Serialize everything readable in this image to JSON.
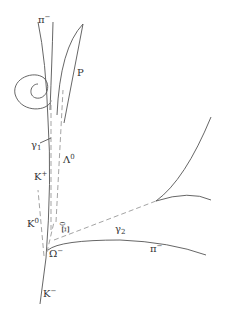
{
  "diagram": {
    "colors": {
      "charged_track": "#555555",
      "neutral_track": "#999999",
      "text": "#333333"
    },
    "legend_convention": {
      "solid": "charged particle track",
      "dashed": "neutral particle path"
    },
    "labels": {
      "pi_minus_top": "π",
      "pi_minus_top_sup": "−",
      "proton": "P",
      "gamma1": "γ",
      "gamma1_sub": "1",
      "lambda0": "Λ",
      "lambda0_sup": "0",
      "k_plus": "K",
      "k_plus_sup": "+",
      "gamma2": "γ",
      "gamma2_sub": "2",
      "k0": "K",
      "k0_sup": "0",
      "xi0": "Ξ",
      "xi0_sup": "0",
      "omega_minus": "Ω",
      "omega_minus_sup": "−",
      "pi_minus_right": "π",
      "pi_minus_right_sup": "−",
      "k_minus": "K",
      "k_minus_sup": "−"
    }
  }
}
